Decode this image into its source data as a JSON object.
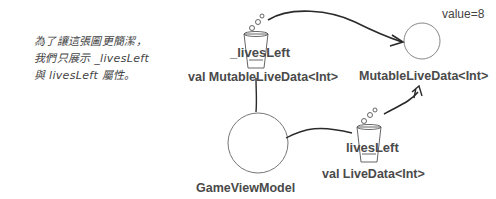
{
  "note": {
    "lines": [
      "為了讓這張圖更簡潔，",
      "我們只展示 _livesLeft",
      "與 livesLeft 屬性。"
    ]
  },
  "private_property": {
    "name": "_livesLeft",
    "type_label": "val MutableLiveData<Int>",
    "icon": "cup-icon"
  },
  "public_property": {
    "name": "livesLeft",
    "type_label": "val LiveData<Int>",
    "icon": "cup-icon"
  },
  "view_model": {
    "label": "GameViewModel"
  },
  "live_data_object": {
    "label": "MutableLiveData<Int>",
    "value_text": "value=8"
  },
  "colors": {
    "stroke": "#2a2a2a",
    "circle": "#7a7a7a",
    "text": "#4a4a4a"
  }
}
